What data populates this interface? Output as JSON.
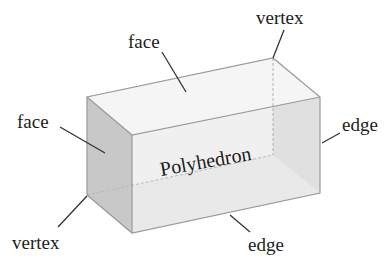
{
  "diagram": {
    "title": "Polyhedron",
    "labels": {
      "face_top": "face",
      "face_left": "face",
      "vertex_top": "vertex",
      "vertex_bottom": "vertex",
      "edge_right": "edge",
      "edge_bottom": "edge"
    },
    "colors": {
      "top_face": "#f4f4f4",
      "front_face": "#e6e6e6",
      "side_face": "#c9c9c9",
      "back_face": "#ebebeb",
      "edge": "#9a9a9a",
      "leader": "#333333"
    }
  }
}
